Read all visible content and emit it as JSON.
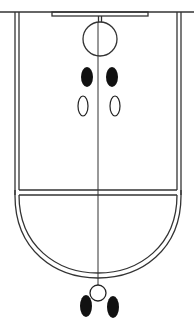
{
  "diagram": {
    "type": "basketball-half-court-play-diagram",
    "colors": {
      "background": "#ffffff",
      "line": "#333333",
      "player_filled": "#111111",
      "player_outline": "#222222"
    },
    "elements": {
      "baseline": {
        "y": 12
      },
      "backboard": {
        "x1": 52,
        "x2": 148,
        "y1": 12,
        "y2": 16
      },
      "hoop": {
        "cx": 100,
        "cy": 39,
        "r": 17
      },
      "lane": {
        "left_x": [
          15,
          19
        ],
        "right_x": [
          177,
          181
        ],
        "free_throw_y": [
          190,
          195
        ]
      },
      "free_throw_arc": {
        "bottom_y": [
          273,
          278
        ]
      },
      "center_line": {
        "x": 98,
        "y1": 22,
        "y2": 284
      }
    },
    "players": [
      {
        "id": "p1",
        "style": "filled",
        "cx": 87,
        "cy": 77,
        "rx": 6,
        "ry": 10
      },
      {
        "id": "p2",
        "style": "filled",
        "cx": 112,
        "cy": 77,
        "rx": 6,
        "ry": 10
      },
      {
        "id": "p3",
        "style": "outline",
        "cx": 83,
        "cy": 106,
        "rx": 5,
        "ry": 10
      },
      {
        "id": "p4",
        "style": "outline",
        "cx": 115,
        "cy": 106,
        "rx": 5,
        "ry": 10
      },
      {
        "id": "p5",
        "style": "filled",
        "cx": 86,
        "cy": 306,
        "rx": 6,
        "ry": 11
      },
      {
        "id": "p6",
        "style": "filled",
        "cx": 113,
        "cy": 307,
        "rx": 6,
        "ry": 11
      }
    ],
    "ball": {
      "cx": 98,
      "cy": 293,
      "r": 8
    }
  }
}
